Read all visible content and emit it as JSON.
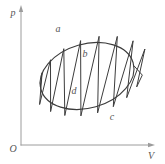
{
  "figure": {
    "background": "#ffffff",
    "stroke_color": "#3c3c3c",
    "axis_color": "#9c9c9c",
    "label_color": "#555555",
    "axes": {
      "y_axis_label": "p",
      "x_axis_label": "V",
      "origin_label": "O",
      "origin": {
        "x": 21,
        "y": 145
      },
      "y_top": 8,
      "x_right": 152
    },
    "labels": {
      "p": {
        "x": 13,
        "y": 13
      },
      "V": {
        "x": 151,
        "y": 156
      },
      "O": {
        "x": 13,
        "y": 149
      }
    },
    "point_labels": [
      {
        "text": "a",
        "x": 58,
        "y": 29
      },
      {
        "text": "b",
        "x": 85,
        "y": 54
      },
      {
        "text": "d",
        "x": 74,
        "y": 91
      },
      {
        "text": "c",
        "x": 112,
        "y": 117
      }
    ],
    "cycle_ellipse": {
      "cx": 87,
      "cy": 76,
      "rx": 48,
      "ry": 32,
      "rotation_deg": -16
    },
    "hatch": {
      "tip_scale": 1.2,
      "top_tip_shift_x": 9,
      "top_tip_angles_deg": [
        -152,
        -133,
        -114,
        -95,
        -76,
        -57,
        -38,
        -19
      ],
      "bottom_tip_angles_deg": [
        158,
        141,
        124,
        107,
        90,
        73,
        56,
        39,
        22
      ],
      "start_angle_deg": 185,
      "end_angle_deg": 5
    }
  }
}
